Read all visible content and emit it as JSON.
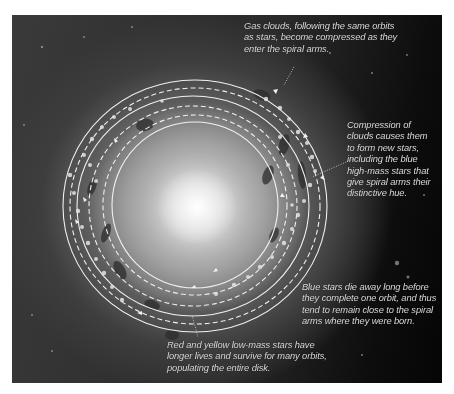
{
  "figure": {
    "colors": {
      "background": "#ffffff",
      "space_dark": "#050505",
      "galaxy_core": "#ffffff",
      "orbit_line": "#f0f0f0",
      "caption_text": "#d9d9d9"
    }
  },
  "annotations": {
    "gas_clouds": {
      "lines": [
        "Gas clouds, following the same orbits",
        "as stars, become compressed as they",
        "enter the spiral arms."
      ]
    },
    "compression": {
      "lines": [
        "Compression of",
        "clouds causes them",
        "to form new stars,",
        "including the blue",
        "high-mass stars that",
        "give spiral arms their",
        "distinctive hue."
      ]
    },
    "blue_stars": {
      "lines": [
        "Blue stars die away long before",
        "they complete one orbit, and thus",
        "tend to remain close to the spiral",
        "arms where they were born."
      ]
    },
    "red_yellow_stars": {
      "lines": [
        "Red and yellow low-mass stars have",
        "longer lives and survive for many orbits,",
        "populating the entire disk."
      ]
    }
  },
  "orbits": [
    {
      "label": "outer-orbit",
      "cx": 183,
      "cy": 191,
      "rx": 132,
      "ry": 126,
      "style": "solid"
    },
    {
      "label": "outer-dashed-orbit",
      "cx": 183,
      "cy": 191,
      "rx": 125,
      "ry": 118,
      "style": "dashed"
    },
    {
      "label": "middle-orbit",
      "cx": 183,
      "cy": 191,
      "rx": 116,
      "ry": 110,
      "style": "solid"
    },
    {
      "label": "middle-dashed-orbit",
      "cx": 183,
      "cy": 191,
      "rx": 104,
      "ry": 100,
      "style": "dashed"
    },
    {
      "label": "inner-dashed-orbit",
      "cx": 183,
      "cy": 190,
      "rx": 92,
      "ry": 90,
      "style": "dashed"
    },
    {
      "label": "inner-orbit",
      "cx": 183,
      "cy": 190,
      "rx": 83,
      "ry": 83,
      "style": "solid"
    }
  ]
}
